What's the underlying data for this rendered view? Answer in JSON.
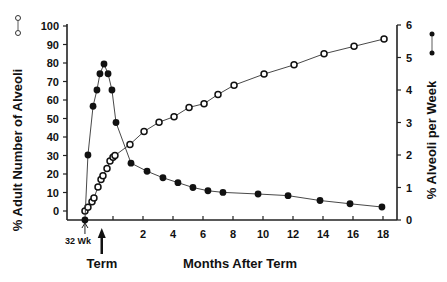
{
  "chart_data": {
    "type": "line",
    "title": "",
    "xlabel": "Months After Term",
    "ylabel_left": "% Adult Number of Alveoli",
    "ylabel_right": "% Alveoli per Week",
    "xlim": [
      -2,
      19
    ],
    "ylim_left": [
      -5,
      100
    ],
    "ylim_right": [
      0,
      6
    ],
    "x_ticks": [
      2,
      4,
      6,
      8,
      10,
      12,
      14,
      16,
      18
    ],
    "x_tick_labels": [
      "2",
      "4",
      "6",
      "8",
      "10",
      "12",
      "14",
      "16",
      "18"
    ],
    "y_left_ticks": [
      0,
      10,
      20,
      30,
      40,
      50,
      60,
      70,
      80,
      90,
      100
    ],
    "y_left_tick_labels": [
      "0",
      "10",
      "20",
      "30",
      "40",
      "50",
      "60",
      "70",
      "80",
      "90",
      "100"
    ],
    "y_right_ticks": [
      0,
      1,
      2,
      3,
      4,
      5,
      6
    ],
    "y_right_tick_labels": [
      "0",
      "1",
      "2",
      "3",
      "4",
      "5",
      "6"
    ],
    "grid": false,
    "annotations": {
      "start_marker": "32 Wk",
      "start_x": -1.87,
      "term_marker": "Term",
      "term_x": -0.75
    },
    "series": [
      {
        "name": "% Adult Number of Alveoli",
        "axis": "left",
        "marker": "open-circle",
        "legend_symbol": "o—o",
        "x": [
          -1.87,
          -1.67,
          -1.4,
          -1.27,
          -1.0,
          -0.8,
          -0.67,
          -0.4,
          -0.2,
          0.0,
          0.13,
          1.13,
          2.07,
          3.07,
          4.07,
          5.07,
          6.07,
          7.0,
          8.07,
          10.07,
          12.07,
          14.07,
          16.07,
          18.07
        ],
        "values": [
          0,
          2,
          5,
          7,
          13,
          17,
          19,
          23,
          27,
          29,
          30,
          36,
          43,
          48,
          51,
          56,
          58,
          63,
          68,
          74,
          79,
          85,
          89,
          93
        ]
      },
      {
        "name": "% Alveoli per Week",
        "axis": "right",
        "marker": "filled-circle",
        "legend_symbol": "•—•",
        "x": [
          -1.87,
          -1.67,
          -1.33,
          -1.07,
          -0.87,
          -0.6,
          -0.33,
          -0.07,
          0.2,
          1.2,
          2.27,
          3.33,
          4.33,
          5.33,
          6.33,
          7.33,
          9.67,
          11.67,
          13.8,
          15.8,
          17.93
        ],
        "values": [
          0,
          2.0,
          3.5,
          4.0,
          4.5,
          4.8,
          4.5,
          4.0,
          3.0,
          1.75,
          1.5,
          1.3,
          1.15,
          1.0,
          0.9,
          0.85,
          0.8,
          0.75,
          0.6,
          0.5,
          0.4
        ]
      }
    ]
  }
}
